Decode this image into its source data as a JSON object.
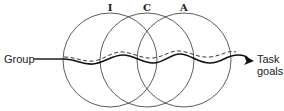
{
  "diagram": {
    "type": "venn-with-path",
    "circles": [
      {
        "label": "I",
        "cx": 110,
        "cy": 60,
        "r": 47
      },
      {
        "label": "C",
        "cx": 147,
        "cy": 60,
        "r": 47
      },
      {
        "label": "A",
        "cx": 184,
        "cy": 60,
        "r": 47
      }
    ],
    "start_label": "Group",
    "end_label_line1": "Task",
    "end_label_line2": "goals",
    "paths": [
      {
        "name": "solid-path",
        "style": "solid"
      },
      {
        "name": "dashed-path",
        "style": "dashed"
      }
    ],
    "colors": {
      "stroke": "#222222",
      "background": "#ffffff"
    }
  }
}
